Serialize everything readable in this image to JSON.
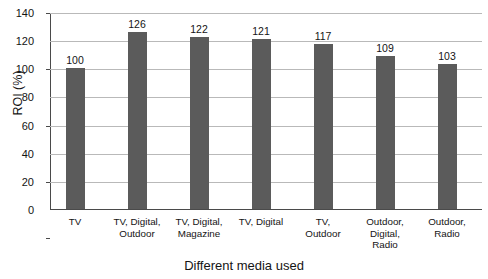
{
  "chart_data": {
    "type": "bar",
    "title_visible_fragment": "",
    "xlabel": "Different media used",
    "ylabel": "ROI (%)",
    "ylim": [
      0,
      140
    ],
    "ytick_step": 20,
    "yticks": [
      140,
      120,
      100,
      80,
      60,
      40,
      20,
      0
    ],
    "categories": [
      "TV",
      "TV, Digital, Outdoor",
      "TV, Digital, Magazine",
      "TV, Digital",
      "TV, Outdoor",
      "Outdoor, Digital, Radio",
      "Outdoor, Radio"
    ],
    "category_lines": [
      [
        "TV"
      ],
      [
        "TV, Digital,",
        "Outdoor"
      ],
      [
        "TV, Digital,",
        "Magazine"
      ],
      [
        "TV, Digital"
      ],
      [
        "TV,",
        "Outdoor"
      ],
      [
        "Outdoor,",
        "Digital,",
        "Radio"
      ],
      [
        "Outdoor,",
        "Radio"
      ]
    ],
    "values": [
      100,
      126,
      122,
      121,
      117,
      109,
      103
    ],
    "value_labels": [
      "100",
      "126",
      "122",
      "121",
      "117",
      "109",
      "103"
    ],
    "grid": true,
    "legend": false,
    "bar_color": "#5b5b5b",
    "grid_color": "#b9b9b9",
    "axis_color": "#4a4a4a",
    "background_color": "#ffffff"
  }
}
